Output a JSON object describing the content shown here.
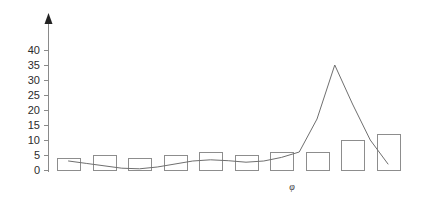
{
  "chart_data": {
    "type": "bar",
    "title": "",
    "subtitle": "",
    "xlabel": "φ",
    "ylabel": "",
    "ylim": [
      0,
      42
    ],
    "yticks": [
      0,
      5,
      10,
      15,
      20,
      25,
      30,
      35,
      40
    ],
    "ytick_labels": [
      "0",
      "5",
      "10",
      "15",
      "20",
      "25",
      "30",
      "35",
      "40"
    ],
    "grid": false,
    "legend": null,
    "legend_position": "none",
    "categories": [
      "1",
      "2",
      "3",
      "4",
      "5",
      "6",
      "7",
      "8",
      "9",
      "10"
    ],
    "series": [
      {
        "name": "histogram",
        "type": "bar",
        "values": [
          4,
          5,
          4,
          5,
          6,
          5,
          6,
          6,
          10,
          12
        ]
      },
      {
        "name": "curve",
        "type": "line",
        "x": [
          0.5,
          1.0,
          1.5,
          2.0,
          2.5,
          3.0,
          3.5,
          4.0,
          4.5,
          5.0,
          5.5,
          6.0,
          6.5,
          7.0,
          7.5,
          8.0,
          8.5,
          9.0,
          9.5
        ],
        "values": [
          3.0,
          2.2,
          1.4,
          0.6,
          0.4,
          1.0,
          2.0,
          3.0,
          3.4,
          3.1,
          2.6,
          3.0,
          4.2,
          6.0,
          17.0,
          35.0,
          22.0,
          10.0,
          2.0
        ]
      }
    ]
  },
  "axis": {
    "y_arrow": "up-arrow",
    "x_axis_label": "φ"
  }
}
